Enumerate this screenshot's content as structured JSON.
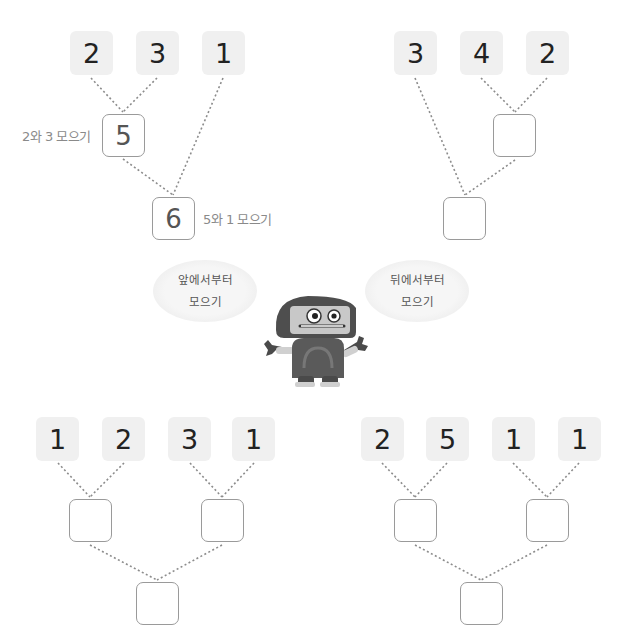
{
  "worksheet": {
    "example": {
      "numbers": [
        "2",
        "3",
        "1"
      ],
      "first_sum": "5",
      "first_label": "2와 3 모으기",
      "second_sum": "6",
      "second_label": "5와 1 모으기"
    },
    "problem_a": {
      "numbers": [
        "3",
        "4",
        "2"
      ],
      "answers": [
        "",
        ""
      ]
    },
    "hints": {
      "left_bubble": [
        "앞에서부터",
        "모으기"
      ],
      "right_bubble": [
        "뒤에서부터",
        "모으기"
      ]
    },
    "problem_b": {
      "numbers": [
        "1",
        "2",
        "3",
        "1"
      ],
      "answers": [
        "",
        "",
        ""
      ]
    },
    "problem_c": {
      "numbers": [
        "2",
        "5",
        "1",
        "1"
      ],
      "answers": [
        "",
        "",
        ""
      ]
    },
    "colors": {
      "number_tile_bg": "#f0f0f0",
      "answer_border": "#9a9a9a",
      "dotted_line": "#8c8c8c",
      "robot_body": "#5a5a5a",
      "robot_face": "#c8c8c8"
    }
  }
}
